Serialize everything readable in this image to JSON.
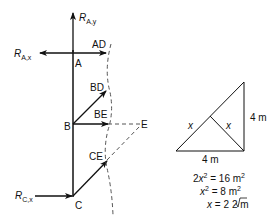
{
  "diagram": {
    "type": "truss free-body diagram with section cut",
    "colors": {
      "line": "#111111",
      "dashed": "#555555",
      "background": "#ffffff"
    },
    "nodes": [
      {
        "id": "A",
        "label": "A"
      },
      {
        "id": "B",
        "label": "B"
      },
      {
        "id": "C",
        "label": "C"
      },
      {
        "id": "E",
        "label": "E"
      }
    ],
    "reactions": {
      "RAy": {
        "main": "R",
        "sub": "A,y"
      },
      "RAx": {
        "main": "R",
        "sub": "A,x"
      },
      "RCx": {
        "main": "R",
        "sub": "C,x"
      }
    },
    "member_forces": [
      {
        "id": "AD",
        "label": "AD"
      },
      {
        "id": "BD",
        "label": "BD"
      },
      {
        "id": "BE",
        "label": "BE"
      },
      {
        "id": "CE",
        "label": "CE"
      }
    ],
    "geometry_sketch": {
      "side_vertical": "4 m",
      "side_horizontal": "4 m",
      "leg_left": "x",
      "leg_right": "x"
    },
    "equations": [
      {
        "lhs_coef": "2",
        "lhs_var": "x",
        "lhs_exp": "2",
        "eq": " = 16 m",
        "rhs_exp": "2"
      },
      {
        "lhs_coef": "",
        "lhs_var": "x",
        "lhs_exp": "2",
        "eq": " = 8 m",
        "rhs_exp": "2"
      },
      {
        "lhs_coef": "",
        "lhs_var": "x",
        "lhs_exp": "",
        "eq": " = 2",
        "sqrt": "2",
        "unit": " m"
      }
    ]
  }
}
